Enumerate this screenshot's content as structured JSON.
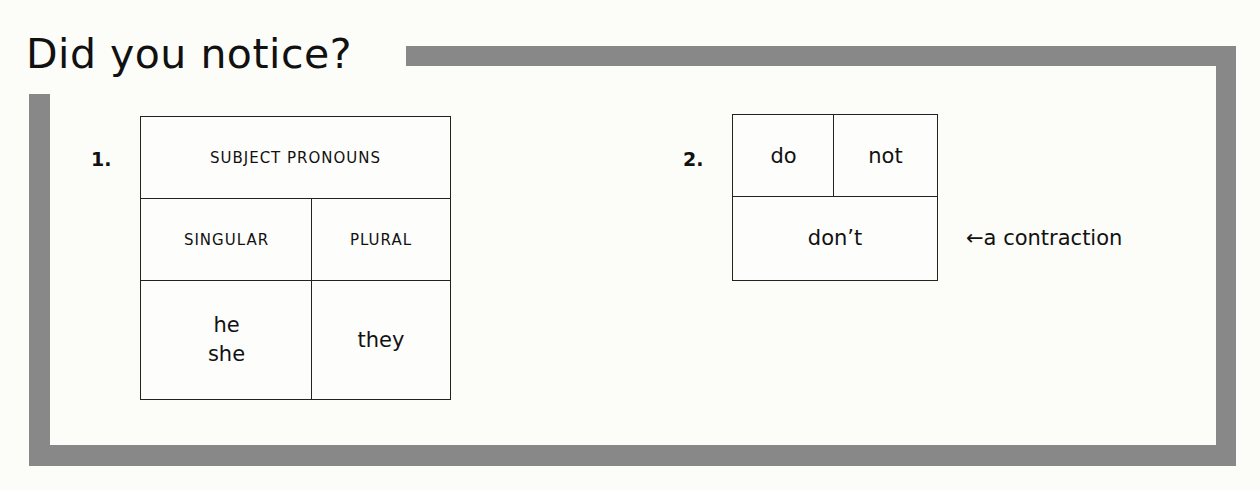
{
  "title": "Did you notice?",
  "colors": {
    "frame": "#888888",
    "background": "#fcfcf8",
    "text": "#111111"
  },
  "section1": {
    "number": "1.",
    "table": {
      "header": "SUBJECT PRONOUNS",
      "columns": [
        "SINGULAR",
        "PLURAL"
      ],
      "singular_values": [
        "he",
        "she"
      ],
      "plural_values": [
        "they"
      ]
    }
  },
  "section2": {
    "number": "2.",
    "table": {
      "parts": [
        "do",
        "not"
      ],
      "result": "don’t"
    },
    "annotation": "←a contraction"
  }
}
